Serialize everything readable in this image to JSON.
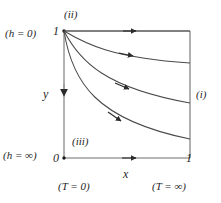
{
  "figure": {
    "type": "diagram",
    "colors": {
      "line": "#6f6f6f",
      "curve": "#4a4a4a",
      "text": "#1f1f1f",
      "background": "#ffffff"
    },
    "domain": {
      "x_range": [
        0,
        1
      ],
      "y_range": [
        0,
        1
      ],
      "box_pixels": {
        "left": 64,
        "top": 31,
        "right": 190,
        "bottom": 158
      }
    },
    "axes": {
      "x_label": "x",
      "y_label": "y",
      "x_ticks": [
        "0",
        "1"
      ],
      "y_ticks": [
        "0",
        "1"
      ],
      "y_direction": "downward",
      "x_direction": "rightward"
    },
    "boundary_labels": {
      "left_top": "(h = 0)",
      "left_bottom": "(h = ∞)",
      "bottom_left": "(T = 0)",
      "bottom_right": "(T = ∞)"
    },
    "region_labels": [
      {
        "id": "i",
        "text": "(i)",
        "position": "right-edge-outside"
      },
      {
        "id": "ii",
        "text": "(ii)",
        "position": "top-left-above"
      },
      {
        "id": "iii",
        "text": "(iii)",
        "position": "interior-lower-left"
      }
    ],
    "tick_values": {
      "y_top": "1",
      "origin": "0",
      "x_right": "1"
    },
    "curves": [
      {
        "name": "top-edge",
        "start": [
          0,
          1
        ],
        "end": [
          1,
          1
        ],
        "arrow_at_x": 0.52,
        "shape": "straight"
      },
      {
        "name": "curve-upper",
        "start": [
          0,
          1
        ],
        "end": [
          1,
          0.745
        ],
        "arrow_at_x": 0.52,
        "shape": "decaying"
      },
      {
        "name": "curve-mid",
        "start": [
          0,
          1
        ],
        "end": [
          1,
          0.425
        ],
        "arrow_at_x": 0.5,
        "shape": "decaying"
      },
      {
        "name": "curve-lower",
        "start": [
          0,
          1
        ],
        "end": [
          1,
          0.145
        ],
        "arrow_at_x": 0.46,
        "shape": "decaying"
      },
      {
        "name": "bottom-edge",
        "start": [
          0,
          0
        ],
        "end": [
          1,
          0
        ],
        "arrow_at_x": 0.52,
        "shape": "straight"
      }
    ]
  }
}
